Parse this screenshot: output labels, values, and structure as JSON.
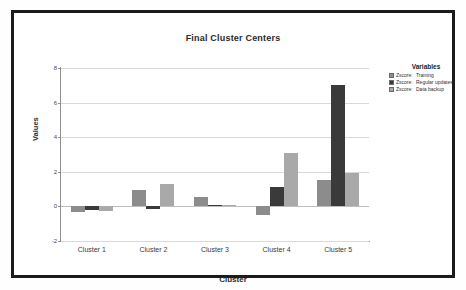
{
  "chart_data": {
    "type": "bar",
    "title": "Final Cluster Centers",
    "xlabel": "Cluster",
    "ylabel": "Values",
    "categories": [
      "Cluster 1",
      "Cluster 2",
      "Cluster 3",
      "Cluster 4",
      "Cluster 5"
    ],
    "series": [
      {
        "name": "Zscore:  Training",
        "color": "#8c8c8c",
        "values": [
          -0.3,
          0.95,
          0.55,
          -0.5,
          1.5
        ]
      },
      {
        "name": "Zscore:  Regular updates",
        "color": "#3a3a3a",
        "values": [
          -0.18,
          -0.15,
          0.08,
          1.1,
          7.0
        ]
      },
      {
        "name": "Zscore:  Data backup",
        "color": "#a9a9a9",
        "values": [
          -0.28,
          1.3,
          0.1,
          3.1,
          1.95
        ]
      }
    ],
    "ylim": [
      -2,
      8
    ],
    "yticks": [
      -2,
      0,
      2,
      4,
      6,
      8
    ],
    "ytick_labels": [
      "-2",
      "0",
      "2",
      "4",
      "6",
      "8"
    ],
    "grid": true,
    "legend_position": "right",
    "legend_title": "Variables"
  },
  "legend": {
    "title": "Variables",
    "entries": [
      {
        "prefix": "Zscore:",
        "name": "Training",
        "color": "#8c8c8c"
      },
      {
        "prefix": "Zscore:",
        "name": "Regular updates",
        "color": "#3a3a3a"
      },
      {
        "prefix": "Zscore:",
        "name": "Data backup",
        "color": "#a9a9a9"
      }
    ]
  }
}
